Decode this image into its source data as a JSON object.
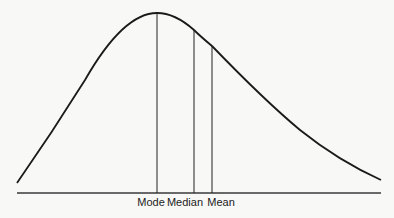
{
  "diagram": {
    "type": "right-skewed distribution curve",
    "line_color": "#1a1a1a",
    "markers": [
      {
        "id": "mode",
        "label": "Mode",
        "x": 157,
        "top": 13
      },
      {
        "id": "median",
        "label": "Median",
        "x": 194,
        "top": 30
      },
      {
        "id": "mean",
        "label": "Mean",
        "x": 212,
        "top": 46
      }
    ]
  }
}
